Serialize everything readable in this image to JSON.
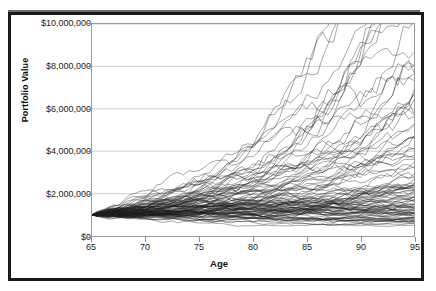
{
  "figure": {
    "caption_fragment": "",
    "border_color": "#1a1a1a",
    "background_color": "#ffffff"
  },
  "axes": {
    "y_title": "Portfolio Value",
    "x_title": "Age",
    "y_ticks": [
      "$0",
      "$2,000,000",
      "$4,000,000",
      "$6,000,000",
      "$8,000,000",
      "$10,000,000"
    ],
    "x_ticks": [
      "65",
      "70",
      "75",
      "80",
      "85",
      "90",
      "95"
    ]
  },
  "chart_data": {
    "type": "line",
    "title": "",
    "subtitle": "",
    "xlabel": "Age",
    "ylabel": "Portfolio Value",
    "xlim": [
      65,
      95
    ],
    "ylim": [
      0,
      10000000
    ],
    "x_tick_values": [
      65,
      70,
      75,
      80,
      85,
      90,
      95
    ],
    "y_tick_values": [
      0,
      2000000,
      4000000,
      6000000,
      8000000,
      10000000
    ],
    "y_tick_labels": [
      "$0",
      "$2,000,000",
      "$4,000,000",
      "$6,000,000",
      "$8,000,000",
      "$10,000,000"
    ],
    "grid": "horizontal",
    "legend": "none",
    "line_color": "#1d1d1d",
    "series_count": 100,
    "start_value": 1000000,
    "x": [
      65,
      70,
      75,
      80,
      85,
      90,
      95
    ],
    "envelope": {
      "min": [
        1000000,
        850000,
        750000,
        700000,
        680000,
        660000,
        650000
      ],
      "p25": [
        1000000,
        1050000,
        1150000,
        1300000,
        1450000,
        1600000,
        1750000
      ],
      "median": [
        1000000,
        1200000,
        1500000,
        1950000,
        2500000,
        3200000,
        4000000
      ],
      "p75": [
        1000000,
        1380000,
        1950000,
        2800000,
        4000000,
        5600000,
        7200000
      ],
      "max": [
        1000000,
        1600000,
        2600000,
        4300000,
        7000000,
        10000000,
        10000000
      ]
    }
  }
}
